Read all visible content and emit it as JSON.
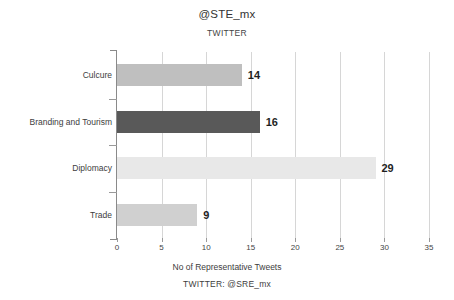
{
  "chart_data": {
    "type": "bar",
    "orientation": "horizontal",
    "title": "@STE_mx",
    "subtitle": "TWITTER",
    "footer": "TWITTER: @SRE_mx",
    "xlabel": "No of Representative Tweets",
    "ylabel": "",
    "categories": [
      "Culcure",
      "Branding and Tourism",
      "Diplomacy",
      "Trade"
    ],
    "values": [
      14,
      16,
      29,
      9
    ],
    "value_labels": [
      "14",
      "16",
      "29",
      "9"
    ],
    "bar_colors": [
      "#bfbfbf",
      "#595959",
      "#e8e8e8",
      "#d0d0d0"
    ],
    "xlim": [
      0,
      35
    ],
    "xticks": [
      0,
      5,
      10,
      15,
      20,
      25,
      30,
      35
    ],
    "xtick_labels": [
      "0",
      "5",
      "10",
      "15",
      "20",
      "25",
      "30",
      "35"
    ],
    "grid": "vertical",
    "gridline_color": "#d6d6d6",
    "axis_color": "#8a8a8a",
    "legend": "none",
    "background": "#ffffff"
  }
}
